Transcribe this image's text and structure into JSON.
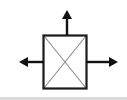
{
  "figure": {
    "name": "square-with-three-arrows",
    "canvas": {
      "width": 127,
      "height": 100,
      "background_color": "#ffffff"
    },
    "colors": {
      "outline": "#1a1a1a",
      "diagonal": "#8c8c8c",
      "arrow": "#111111",
      "background": "#ffffff",
      "bottom_edge_shadow": "#d9d9d9"
    },
    "square": {
      "label": "square-body",
      "x": 43.5,
      "y": 35.5,
      "width": 43,
      "height": 53,
      "stroke_width": 2.2
    },
    "diagonals": [
      {
        "label": "diagonal-top-left-to-bottom-right",
        "x1": 44,
        "y1": 36,
        "x2": 86,
        "y2": 88,
        "stroke_width": 1.1
      },
      {
        "label": "diagonal-bottom-left-to-top-right",
        "x1": 44,
        "y1": 88,
        "x2": 86,
        "y2": 36,
        "stroke_width": 1.1
      }
    ],
    "arrows": [
      {
        "label": "arrow-up",
        "direction": "up",
        "shaft": {
          "x1": 67,
          "y1": 35,
          "x2": 67,
          "y2": 18
        },
        "tip": {
          "x": 67,
          "y": 10
        },
        "head_half_width": 5,
        "head_length": 9,
        "shaft_width": 2.4
      },
      {
        "label": "arrow-left",
        "direction": "left",
        "shaft": {
          "x1": 44,
          "y1": 62,
          "x2": 28,
          "y2": 62
        },
        "tip": {
          "x": 19,
          "y": 62
        },
        "head_half_width": 5,
        "head_length": 9,
        "shaft_width": 2.4
      },
      {
        "label": "arrow-right",
        "direction": "right",
        "shaft": {
          "x1": 86,
          "y1": 62,
          "x2": 109,
          "y2": 62
        },
        "tip": {
          "x": 118,
          "y": 62
        },
        "head_half_width": 5,
        "head_length": 9,
        "shaft_width": 2.4
      }
    ],
    "bottom_edge": {
      "label": "bottom-shadow-band",
      "y": 97,
      "height": 3
    }
  }
}
